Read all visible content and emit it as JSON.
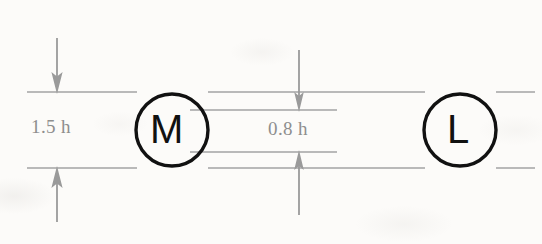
{
  "figure": {
    "type": "dimensioned-schematic",
    "background_color": "#fcfbf9",
    "line_color": "#a3a3a3",
    "ink_color": "#111111",
    "dimension_text_color": "#8e8e8e"
  },
  "nodes": [
    {
      "id": "node-m",
      "label": "M",
      "cx": 172,
      "cy": 130,
      "r": 36
    },
    {
      "id": "node-l",
      "label": "L",
      "cx": 460,
      "cy": 130,
      "r": 36
    }
  ],
  "dimensions": [
    {
      "id": "dim-left",
      "label": "1.5 h",
      "value": 1.5,
      "unit": "h",
      "text_x": 31,
      "text_y": 116,
      "arrow_x": 57,
      "top_line_y": 92,
      "bottom_line_y": 168
    },
    {
      "id": "dim-middle",
      "label": "0.8 h",
      "value": 0.8,
      "unit": "h",
      "text_x": 268,
      "text_y": 118,
      "arrow_x": 299,
      "top_line_y": 110,
      "bottom_line_y": 152
    }
  ],
  "guide_lines": [
    {
      "id": "outer-top",
      "y": 92,
      "x1": 27,
      "x2": 535
    },
    {
      "id": "outer-bottom",
      "y": 168,
      "x1": 27,
      "x2": 535
    },
    {
      "id": "inner-top",
      "y": 110,
      "x1": 190,
      "x2": 337
    },
    {
      "id": "inner-bottom",
      "y": 152,
      "x1": 190,
      "x2": 337
    }
  ]
}
